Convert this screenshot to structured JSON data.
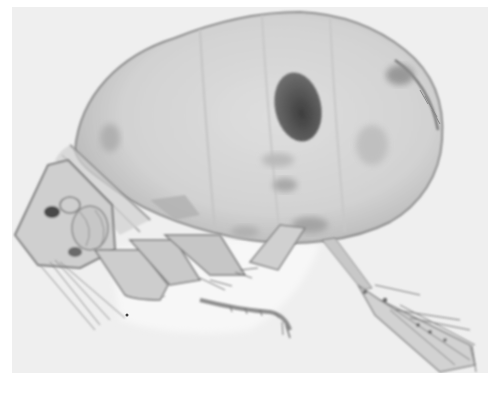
{
  "image": {
    "subject": "copepod crustacean under light microscope",
    "mode": "grayscale brightfield micrograph",
    "alt": "Microscope photograph of a copepod with a large oval body, a dark oval spot, segmented head on the left, and legs and feathered tail appendages extending down and right",
    "colors": {
      "page_background": "#ffffff",
      "photo_background": "#efefef",
      "body_fill": "#d6d6d6",
      "body_edge": "#8a8a8a",
      "dark_spot": "#5a5a5a",
      "appendage_line": "#7a7a7a"
    },
    "regions": {
      "photo_frame": {
        "x": 12,
        "y": 7,
        "width": 476,
        "height": 366
      },
      "body": "large oval carapace spanning approx x 70-445, y 10-245",
      "dark_spot": "oval near x 290, y 105",
      "head": "angular head segment approx x 15-115, y 160-270",
      "legs": "swimming legs below body approx x 60-290, y 190-335",
      "tail": "caudal appendage extending to lower-right approx x 320-480, y 240-370"
    }
  }
}
